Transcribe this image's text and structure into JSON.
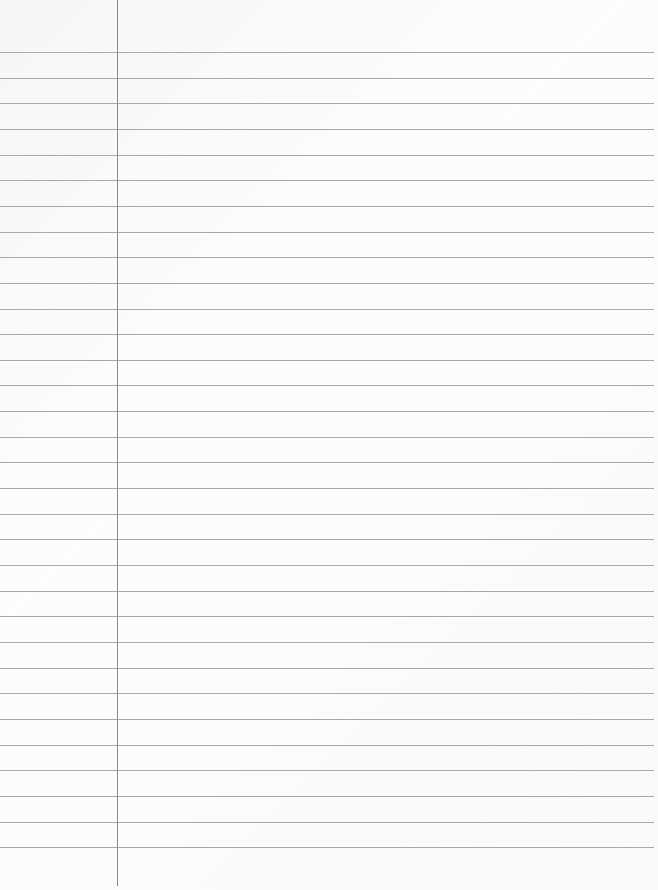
{
  "paper": {
    "type": "lined notebook paper",
    "background_color": "#fbfbfb",
    "rule_color": "#8e8e8e",
    "margin_line_color": "#6e6e6e",
    "first_rule_y": 52,
    "rule_spacing": 25.65,
    "rule_count": 32,
    "margin_x": 117
  }
}
